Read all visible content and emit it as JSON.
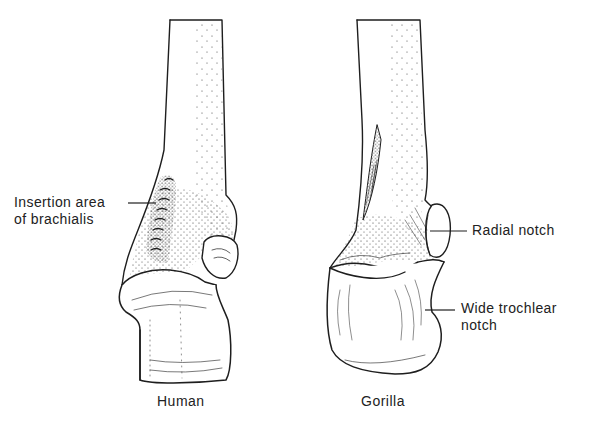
{
  "figure": {
    "specimens": [
      {
        "id": "human",
        "caption": "Human"
      },
      {
        "id": "gorilla",
        "caption": "Gorilla"
      }
    ],
    "labels": {
      "insertion_line1": "Insertion area",
      "insertion_line2": "of brachialis",
      "radial_notch": "Radial notch",
      "trochlear_line1": "Wide trochlear",
      "trochlear_line2": "notch"
    },
    "colors": {
      "ink": "#1e1e1e",
      "background": "#ffffff"
    }
  }
}
